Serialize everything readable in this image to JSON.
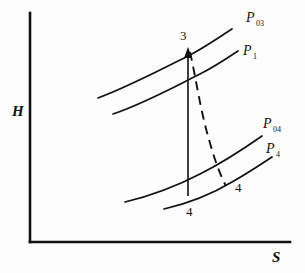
{
  "figure": {
    "kind": "h-s-mollier-diagram",
    "background_color": "#fdfdfd",
    "line_color": "#111111"
  },
  "axes": {
    "y_label": "H",
    "x_label": "S",
    "origin": {
      "x": 30,
      "y": 242
    },
    "y_top": 13,
    "x_right": 290
  },
  "curves": [
    {
      "id": "p03",
      "label": "P",
      "subscript": "03",
      "label_x": 246,
      "label_y": 22,
      "path": "M 98 98 C 130 86 160 70 190 55 C 205 47 218 38 232 29"
    },
    {
      "id": "p1",
      "label": "P",
      "subscript": "1",
      "label_x": 243,
      "label_y": 55,
      "path": "M 113 114 C 145 103 172 88 200 74 C 214 67 226 59 238 51"
    },
    {
      "id": "p04",
      "label": "P",
      "subscript": "04",
      "label_x": 263,
      "label_y": 128,
      "path": "M 125 202 C 150 196 175 187 200 174 C 222 163 242 150 262 136"
    },
    {
      "id": "p4",
      "label": "P",
      "subscript": "4",
      "label_x": 266,
      "label_y": 153,
      "path": "M 164 209 C 190 203 212 194 232 182 C 248 173 260 165 272 157"
    }
  ],
  "processes": [
    {
      "id": "isentropic-3-4",
      "style": "solid-with-arrow",
      "from": {
        "x": 188,
        "y": 196
      },
      "to": {
        "x": 188,
        "y": 50
      }
    },
    {
      "id": "actual-expansion-3-4",
      "style": "dashed",
      "path": "M 190 52 C 196 78 200 108 208 136 C 214 158 220 175 226 186"
    }
  ],
  "state_points": [
    {
      "id": "state-3",
      "label": "3",
      "x": 180,
      "y": 40
    },
    {
      "id": "state-4-ideal",
      "label": "4",
      "x": 186,
      "y": 216
    },
    {
      "id": "state-4-actual",
      "label": "4",
      "x": 235,
      "y": 192
    }
  ]
}
